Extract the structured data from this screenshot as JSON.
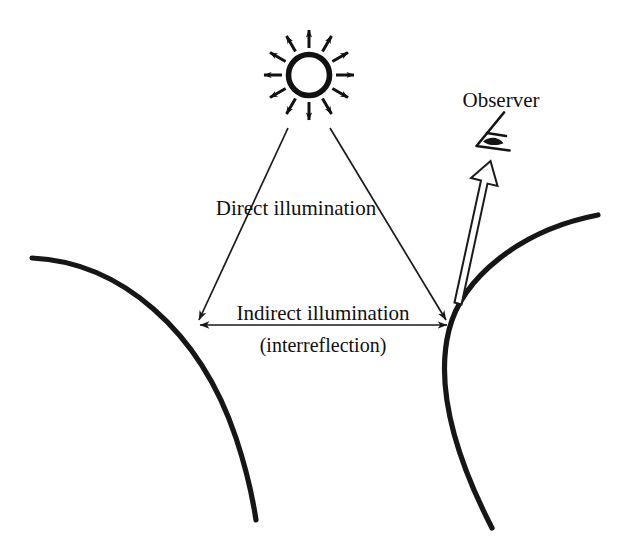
{
  "figure": {
    "background_color": "#ffffff",
    "ink_color": "#141414",
    "labels": {
      "direct": "Direct illumination",
      "indirect": "Indirect illumination",
      "interreflection": "(interreflection)",
      "observer": "Observer"
    },
    "icons": {
      "sun": "sun-icon",
      "eye": "eye-icon",
      "view_ray": "hollow-arrow-icon"
    },
    "sun": {
      "center_x": 309,
      "center_y": 75,
      "radius": 21,
      "ray_count": 12,
      "ray_inner_radius": 27,
      "ray_outer_radius": 49
    },
    "surfaces": [
      {
        "name": "left-surface",
        "label": "left curved surface"
      },
      {
        "name": "right-surface",
        "label": "right curved surface"
      }
    ],
    "contact_points": [
      {
        "name": "left-contact-point",
        "x": 197,
        "y": 324
      },
      {
        "name": "right-contact-point",
        "x": 449,
        "y": 325
      }
    ],
    "arrows": {
      "direct_left": {
        "from_x": 288,
        "from_y": 128,
        "to_x": 197,
        "to_y": 324
      },
      "direct_right": {
        "from_x": 330,
        "from_y": 128,
        "to_x": 449,
        "to_y": 325
      },
      "indirect": {
        "from_x": 197,
        "from_y": 325,
        "to_x": 450,
        "to_y": 325,
        "double_headed": true
      },
      "view_ray": {
        "from_x": 455,
        "from_y": 300,
        "to_x": 489,
        "to_y": 166
      }
    }
  }
}
